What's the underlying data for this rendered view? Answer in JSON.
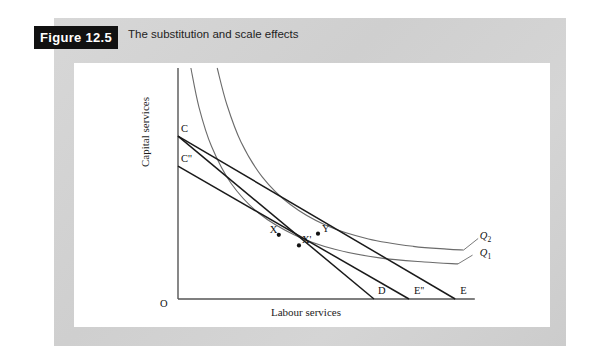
{
  "figure": {
    "badge": "Figure 12.5",
    "caption": "The substitution and scale effects"
  },
  "colors": {
    "mat": "#d2d2d2",
    "badge_bg": "#111111",
    "badge_fg": "#ffffff",
    "axis": "#555555",
    "isoquant": "#6b6b6b",
    "isocost": "#1a1a1a",
    "page_bg": "#ffffff"
  },
  "chart_data": {
    "type": "line",
    "title": "The substitution and scale effects",
    "xlabel": "Labour services",
    "ylabel": "Capital services",
    "origin_label": "O",
    "grid": false,
    "legend": "inline-curve-labels",
    "axis_ranges": {
      "x": [
        0,
        1
      ],
      "y": [
        0,
        1
      ]
    },
    "series": [
      {
        "name": "Q1",
        "label": "Q",
        "label_sub": "1",
        "kind": "isoquant",
        "points": [
          [
            0.046,
            1.0
          ],
          [
            0.075,
            0.83
          ],
          [
            0.12,
            0.66
          ],
          [
            0.19,
            0.5
          ],
          [
            0.29,
            0.37
          ],
          [
            0.42,
            0.275
          ],
          [
            0.56,
            0.215
          ],
          [
            0.72,
            0.178
          ],
          [
            0.88,
            0.16
          ],
          [
            1.0,
            0.152
          ]
        ]
      },
      {
        "name": "Q2",
        "label": "Q",
        "label_sub": "2",
        "kind": "isoquant",
        "points": [
          [
            0.14,
            1.0
          ],
          [
            0.175,
            0.84
          ],
          [
            0.225,
            0.68
          ],
          [
            0.3,
            0.53
          ],
          [
            0.4,
            0.41
          ],
          [
            0.53,
            0.318
          ],
          [
            0.68,
            0.26
          ],
          [
            0.84,
            0.228
          ],
          [
            0.96,
            0.216
          ],
          [
            1.02,
            0.212
          ]
        ]
      }
    ],
    "isocost_lines": [
      {
        "name": "CD",
        "from_label": "C",
        "to_label": "D",
        "from": [
          0.0,
          0.705
        ],
        "to": [
          0.7,
          0.0
        ]
      },
      {
        "name": "CE",
        "from_label": "C",
        "to_label": "E",
        "from": [
          0.0,
          0.705
        ],
        "to": [
          0.99,
          0.0
        ]
      },
      {
        "name": "C''E''",
        "from_label": "C''",
        "to_label": "E''",
        "from": [
          0.0,
          0.575
        ],
        "to": [
          0.825,
          0.0
        ]
      }
    ],
    "points": [
      {
        "label": "X",
        "x": 0.36,
        "y": 0.278,
        "label_dx": -9,
        "label_dy": -11
      },
      {
        "label": "X'",
        "x": 0.432,
        "y": 0.232,
        "label_dx": 3,
        "label_dy": -11
      },
      {
        "label": "Y",
        "x": 0.5,
        "y": 0.283,
        "label_dx": 4,
        "label_dy": -11
      }
    ],
    "axis_point_labels": [
      {
        "label": "C",
        "x": 0.0,
        "y": 0.705,
        "anchor": "left-above"
      },
      {
        "label": "C''",
        "x": 0.0,
        "y": 0.575,
        "anchor": "left-above"
      },
      {
        "label": "D",
        "x": 0.7,
        "y": 0.0,
        "anchor": "above-right"
      },
      {
        "label": "E''",
        "x": 0.825,
        "y": 0.0,
        "anchor": "above-right"
      },
      {
        "label": "E",
        "x": 0.99,
        "y": 0.0,
        "anchor": "above-right"
      }
    ]
  }
}
